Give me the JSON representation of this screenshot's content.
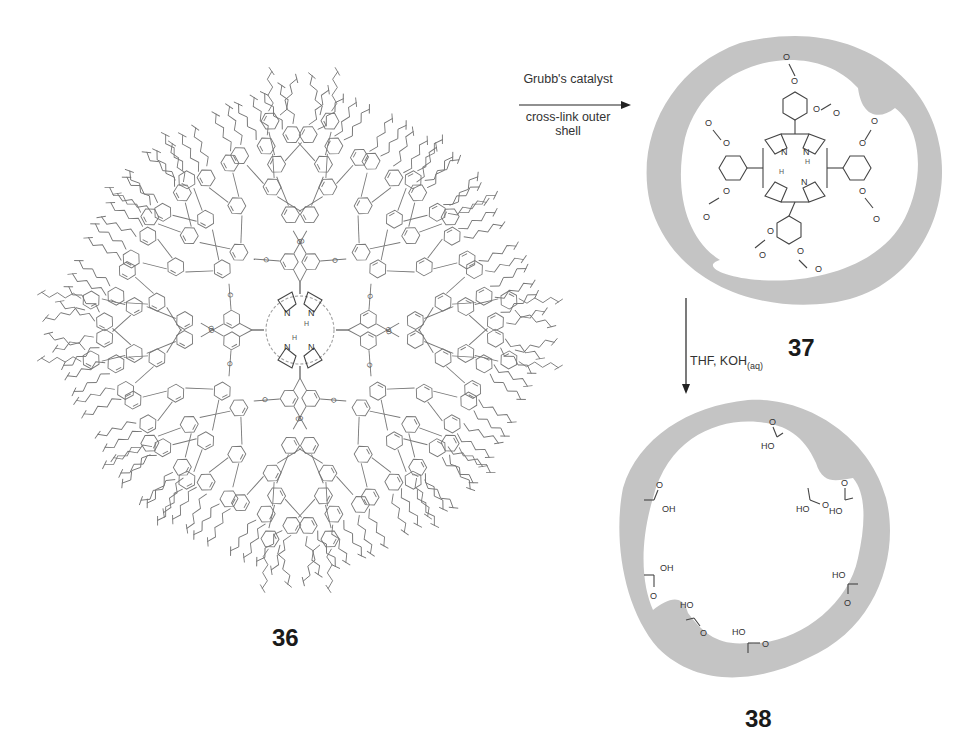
{
  "scheme": {
    "compounds": [
      {
        "id": "36",
        "label": "36",
        "description": "porphyrin-core dendrimer with terminal alkene chains"
      },
      {
        "id": "37",
        "label": "37",
        "description": "cross-linked shell around porphyrin core with ester linkages"
      },
      {
        "id": "38",
        "label": "38",
        "description": "hollow cross-linked nanocapsule with carboxylic acid groups"
      }
    ],
    "arrows": [
      {
        "id": "step1",
        "direction": "right",
        "above": "Grubb's catalyst",
        "below_line1": "cross-link outer",
        "below_line2": "shell"
      },
      {
        "id": "step2",
        "direction": "down",
        "label_main": "THF, KOH",
        "label_sub": "(aq)"
      }
    ],
    "atoms": {
      "N": "N",
      "H": "H",
      "O": "O",
      "OH": "OH",
      "HO": "HO"
    },
    "colors": {
      "shell": "#c4c4c4",
      "line": "#444444",
      "light_line": "#777777",
      "text": "#222222"
    }
  }
}
